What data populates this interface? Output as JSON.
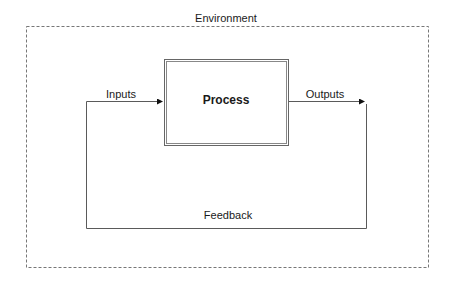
{
  "diagram": {
    "environment_label": "Environment",
    "process_label": "Process",
    "inputs_label": "Inputs",
    "outputs_label": "Outputs",
    "feedback_label": "Feedback"
  },
  "colors": {
    "line": "#5a5a5a",
    "dashed": "#777777",
    "text": "#1a1a1a"
  }
}
